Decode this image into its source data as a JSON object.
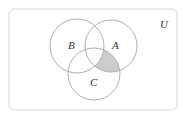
{
  "diagram": {
    "type": "venn",
    "universe_label": "U",
    "sets": [
      {
        "label": "A",
        "cx": 111,
        "cy": 46,
        "r": 26
      },
      {
        "label": "B",
        "cx": 77,
        "cy": 46,
        "r": 27
      },
      {
        "label": "C",
        "cx": 94,
        "cy": 74,
        "r": 26
      }
    ],
    "shaded_region": "A ∩ C ∩ B'",
    "colors": {
      "stroke": "#b0b0b0",
      "shade": "#cccccc",
      "border": "#d8d8d8",
      "text": "#333333"
    }
  }
}
